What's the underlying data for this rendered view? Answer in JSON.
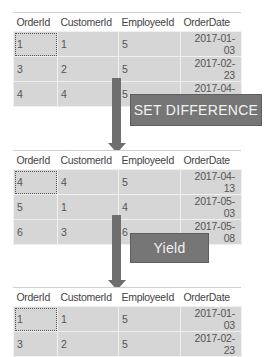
{
  "columns": [
    "OrderId",
    "CustomerId",
    "EmployeeId",
    "OrderDate"
  ],
  "tables": [
    {
      "rows": [
        [
          "1",
          "1",
          "5",
          "2017-01-03"
        ],
        [
          "3",
          "2",
          "5",
          "2017-02-23"
        ],
        [
          "4",
          "4",
          "5",
          "2017-04-13"
        ]
      ]
    },
    {
      "rows": [
        [
          "4",
          "4",
          "5",
          "2017-04-13"
        ],
        [
          "5",
          "1",
          "4",
          "2017-05-03"
        ],
        [
          "6",
          "3",
          "6",
          "2017-05-08"
        ]
      ]
    },
    {
      "rows": [
        [
          "1",
          "1",
          "5",
          "2017-01-03"
        ],
        [
          "3",
          "2",
          "5",
          "2017-02-23"
        ]
      ]
    }
  ],
  "operations": {
    "first": "SET DIFFERENCE",
    "second": "Yield"
  },
  "colors": {
    "arrow": "#6e6e6e",
    "label_bg": "#767676",
    "cell_bg": "#d6d6d6"
  }
}
